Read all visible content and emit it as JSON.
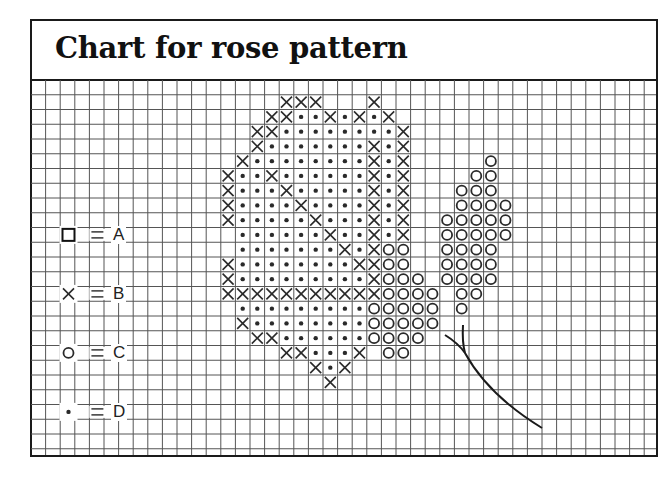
{
  "title": "Chart for rose pattern",
  "grid": {
    "cols": 43,
    "rows": 26,
    "origin_x": 31,
    "origin_y": 80,
    "cell_w": 14.6,
    "cell_h": 14.75,
    "line_color": "#555555"
  },
  "legend": [
    {
      "symbol": "square",
      "symbol_name": "square-icon",
      "label": "A",
      "row": 10
    },
    {
      "symbol": "cross",
      "symbol_name": "cross-icon",
      "label": "B",
      "row": 14
    },
    {
      "symbol": "circle",
      "symbol_name": "circle-icon",
      "label": "C",
      "row": 18
    },
    {
      "symbol": "dot",
      "symbol_name": "dot-icon",
      "label": "D",
      "row": 22
    }
  ],
  "pattern_key": {
    "X": "B",
    "O": "C",
    "*": "D",
    ".": "empty"
  },
  "pattern_rows": [
    {
      "row": 1,
      "start_col": 13,
      "cells": "....XXX...X........."
    },
    {
      "row": 2,
      "start_col": 13,
      "cells": "...XX**X*X*X........"
    },
    {
      "row": 3,
      "start_col": 13,
      "cells": "..XX********X......."
    },
    {
      "row": 4,
      "start_col": 13,
      "cells": "..X*******X*X......."
    },
    {
      "row": 5,
      "start_col": 13,
      "cells": ".X********X*X.....O."
    },
    {
      "row": 6,
      "start_col": 13,
      "cells": "X**X******X*X....OO."
    },
    {
      "row": 7,
      "start_col": 13,
      "cells": "X***X*****X*X...OOO."
    },
    {
      "row": 8,
      "start_col": 13,
      "cells": "X****X****X*X...OOOO"
    },
    {
      "row": 9,
      "start_col": 13,
      "cells": "X*****X***X*X..OOOOO"
    },
    {
      "row": 10,
      "start_col": 13,
      "cells": ".******X**X*X..OOOOO"
    },
    {
      "row": 11,
      "start_col": 13,
      "cells": ".*******X*XOO..OOOO."
    },
    {
      "row": 12,
      "start_col": 13,
      "cells": "X********XXOO..OOOO."
    },
    {
      "row": 13,
      "start_col": 13,
      "cells": "X*********XOOO.OOOO."
    },
    {
      "row": 14,
      "start_col": 13,
      "cells": "XXXXXXXXXXXOOOO.OO.."
    },
    {
      "row": 15,
      "start_col": 13,
      "cells": ".*********OOOOO.O..."
    },
    {
      "row": 16,
      "start_col": 13,
      "cells": ".X********OOOOO....."
    },
    {
      "row": 17,
      "start_col": 13,
      "cells": "..XX******OOOO......"
    },
    {
      "row": 18,
      "start_col": 13,
      "cells": "....XX***X.OO......."
    },
    {
      "row": 19,
      "start_col": 13,
      "cells": "......X*X..........."
    },
    {
      "row": 20,
      "start_col": 13,
      "cells": ".......X............"
    }
  ],
  "stem": {
    "main_path": "M445 335 Q458 343 465 353 Q488 395 542 428",
    "branch_path": "M463 325 Q462 342 465 353",
    "color": "#1a1a1a"
  }
}
